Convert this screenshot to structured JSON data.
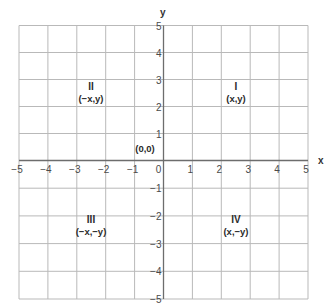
{
  "diagram": {
    "type": "coordinate-plane",
    "x_axis": {
      "label": "x",
      "min": -5,
      "max": 5,
      "ticks": [
        "−5",
        "−4",
        "−3",
        "−2",
        "−1",
        "0",
        "1",
        "2",
        "3",
        "4",
        "5"
      ]
    },
    "y_axis": {
      "label": "y",
      "min": -5,
      "max": 5,
      "ticks_positive": [
        "5",
        "4",
        "3",
        "2",
        "1"
      ],
      "ticks_negative": [
        "−1",
        "−2",
        "−3",
        "−4",
        "−5"
      ]
    },
    "origin": {
      "label": "(0,0)"
    },
    "quadrants": [
      {
        "id": "I",
        "name": "I",
        "coords": "(x,y)"
      },
      {
        "id": "II",
        "name": "II",
        "coords": "(−x,y)"
      },
      {
        "id": "III",
        "name": "III",
        "coords": "(−x,−y)"
      },
      {
        "id": "IV",
        "name": "IV",
        "coords": "(x,−y)"
      }
    ],
    "colors": {
      "grid": "#b9b9b9",
      "axis": "#6d6d6d",
      "text": "#2b2b2b",
      "background": "#ffffff"
    }
  }
}
